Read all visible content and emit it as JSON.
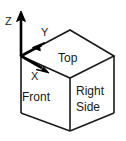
{
  "diagram": {
    "colors": {
      "line": "#1a1a1a",
      "axis": "#000000",
      "background": "#ffffff",
      "text": "#1a1a1a"
    },
    "axes": [
      {
        "id": "z",
        "label": "Z",
        "direction": "up",
        "from": [
          21,
          56
        ],
        "to": [
          21,
          13
        ]
      },
      {
        "id": "y",
        "label": "Y",
        "direction": "up-right",
        "from": [
          21,
          56
        ],
        "to": [
          47,
          40
        ]
      },
      {
        "id": "x",
        "label": "X",
        "direction": "down-right",
        "from": [
          21,
          56
        ],
        "to": [
          49,
          73
        ]
      }
    ],
    "faces": [
      {
        "id": "top",
        "label": "Top"
      },
      {
        "id": "front",
        "label": "Front"
      },
      {
        "id": "right-side",
        "label": "Right",
        "label2": "Side"
      }
    ],
    "cube": {
      "origin_corner": [
        21,
        56
      ],
      "vertices": {
        "top_back": [
          70,
          30
        ],
        "top_left": [
          21,
          56
        ],
        "top_right": [
          114,
          56
        ],
        "top_front": [
          70,
          78
        ],
        "bottom_left": [
          21,
          113
        ],
        "bottom_right": [
          114,
          113
        ],
        "bottom_front": [
          70,
          131
        ]
      }
    }
  }
}
